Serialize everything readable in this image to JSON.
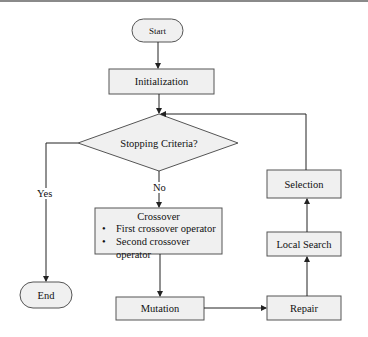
{
  "background_text": {
    "line1": "",
    "line2": ""
  },
  "diagram": {
    "type": "flowchart",
    "nodes": {
      "start": {
        "label": "Start",
        "shape": "terminal"
      },
      "initialization": {
        "label": "Initialization",
        "shape": "process"
      },
      "stopping": {
        "label": "Stopping Criteria?",
        "shape": "decision"
      },
      "crossover": {
        "label": "Crossover",
        "shape": "process",
        "bullets": [
          "First crossover operator",
          "Second crossover operator"
        ]
      },
      "mutation": {
        "label": "Mutation",
        "shape": "process"
      },
      "repair": {
        "label": "Repair",
        "shape": "process"
      },
      "local_search": {
        "label": "Local Search",
        "shape": "process"
      },
      "selection": {
        "label": "Selection",
        "shape": "process"
      },
      "end": {
        "label": "End",
        "shape": "terminal"
      }
    },
    "edges": [
      {
        "from": "Start",
        "to": "Initialization",
        "label": ""
      },
      {
        "from": "Initialization",
        "to": "Stopping Criteria?",
        "label": ""
      },
      {
        "from": "Stopping Criteria?",
        "to": "End",
        "label": "Yes"
      },
      {
        "from": "Stopping Criteria?",
        "to": "Crossover",
        "label": "No"
      },
      {
        "from": "Crossover",
        "to": "Mutation",
        "label": ""
      },
      {
        "from": "Mutation",
        "to": "Repair",
        "label": ""
      },
      {
        "from": "Repair",
        "to": "Local Search",
        "label": ""
      },
      {
        "from": "Local Search",
        "to": "Selection",
        "label": ""
      },
      {
        "from": "Selection",
        "to": "Stopping Criteria?",
        "label": ""
      }
    ],
    "edge_labels": {
      "yes": "Yes",
      "no": "No"
    },
    "colors": {
      "fill": "#f0f0f0",
      "stroke": "#555555",
      "text": "#111111",
      "background": "#ffffff"
    }
  }
}
